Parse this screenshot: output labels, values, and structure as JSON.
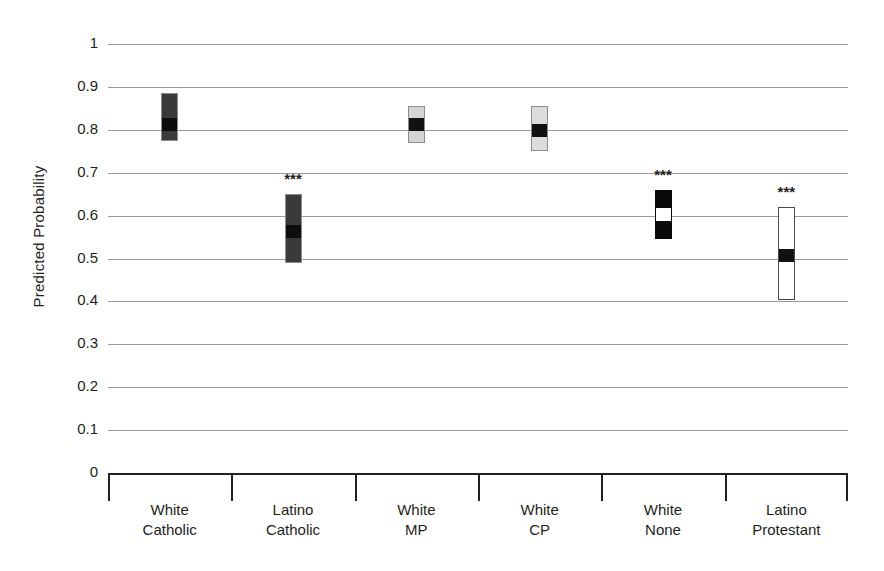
{
  "chart_data": {
    "type": "bar",
    "title": "",
    "xlabel": "",
    "ylabel": "Predicted Probability",
    "ylim": [
      0,
      1
    ],
    "yticks": [
      "0",
      "0.1",
      "0.2",
      "0.3",
      "0.4",
      "0.5",
      "0.6",
      "0.7",
      "0.8",
      "0.9",
      "1"
    ],
    "grid": true,
    "legend": "none",
    "categories": [
      "White\nCatholic",
      "Latino\nCatholic",
      "White\nMP",
      "White\nCP",
      "White\nNone",
      "Latino\nProtestant"
    ],
    "series": [
      {
        "name": "Predicted Probability with 95% CI",
        "points": [
          {
            "category": "White Catholic",
            "line1": "White",
            "line2": "Catholic",
            "value": 0.815,
            "ci_low": 0.775,
            "ci_high": 0.885,
            "significance": "",
            "fill": "#3a3a3a",
            "marker_fill": "#0d0d0d",
            "border": "#8c8c8c"
          },
          {
            "category": "Latino Catholic",
            "line1": "Latino",
            "line2": "Catholic",
            "value": 0.565,
            "ci_low": 0.49,
            "ci_high": 0.65,
            "significance": "***",
            "fill": "#3a3a3a",
            "marker_fill": "#0d0d0d",
            "border": "#8c8c8c"
          },
          {
            "category": "White MP",
            "line1": "White",
            "line2": "MP",
            "value": 0.815,
            "ci_low": 0.77,
            "ci_high": 0.855,
            "significance": "",
            "fill": "#d4d4d4",
            "marker_fill": "#111111",
            "border": "#8c8c8c"
          },
          {
            "category": "White CP",
            "line1": "White",
            "line2": "CP",
            "value": 0.8,
            "ci_low": 0.75,
            "ci_high": 0.855,
            "significance": "",
            "fill": "#dcdcdc",
            "marker_fill": "#111111",
            "border": "#8c8c8c"
          },
          {
            "category": "White None",
            "line1": "White",
            "line2": "None",
            "value": 0.605,
            "ci_low": 0.545,
            "ci_high": 0.66,
            "significance": "***",
            "fill": "#0a0a0a",
            "marker_fill": "#ffffff",
            "border": "#0a0a0a"
          },
          {
            "category": "Latino Protestant",
            "line1": "Latino",
            "line2": "Protestant",
            "value": 0.51,
            "ci_low": 0.403,
            "ci_high": 0.62,
            "significance": "***",
            "fill": "#ffffff",
            "marker_fill": "#111111",
            "border": "#4a4a4a"
          }
        ]
      }
    ],
    "colors": {
      "gridline": "#9a9a9a",
      "axis": "#231f20",
      "text": "#231f20",
      "background": "#ffffff"
    }
  }
}
